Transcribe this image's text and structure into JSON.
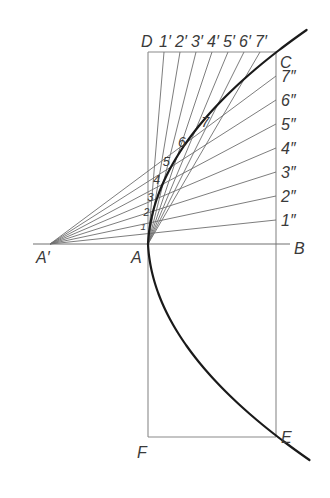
{
  "labels": {
    "D": "D",
    "C": "C",
    "A": "A",
    "A_prime": "A′",
    "B": "B",
    "E": "E",
    "F": "F"
  },
  "division_count": 7,
  "top_edge_points": [
    "1′",
    "2′",
    "3′",
    "4′",
    "5′",
    "6′",
    "7′"
  ],
  "right_edge_points": [
    "1″",
    "2″",
    "3″",
    "4″",
    "5″",
    "6″",
    "7″"
  ],
  "curve_points": [
    "1",
    "2",
    "3",
    "4",
    "5",
    "6",
    "7"
  ],
  "colors": {
    "curve": "#1a1a1a",
    "construction_lines": "#6e6e6e",
    "frame": "#8a8a8a",
    "text": "#3a3a3a",
    "background": "#ffffff"
  }
}
